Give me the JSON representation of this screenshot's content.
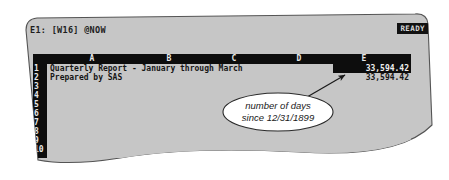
{
  "app": {
    "type": "dos-spreadsheet",
    "status_bar": {
      "cell_reference": "E1: [W16] @NOW",
      "mode_indicator": "READY"
    }
  },
  "worksheet": {
    "column_headers": [
      "A",
      "B",
      "C",
      "D",
      "E"
    ],
    "row_numbers": [
      "1",
      "2",
      "3",
      "4",
      "5",
      "6",
      "7",
      "8",
      "9",
      "10"
    ],
    "rows": [
      {
        "row": "1",
        "label_cell": "Quarterly Report - January through March",
        "value_cell": "33,594.42",
        "value_selected": true
      },
      {
        "row": "2",
        "label_cell": "Prepared by SAS",
        "value_cell": "33,594.42",
        "value_selected": false
      }
    ]
  },
  "annotation": {
    "callout_line_1": "number of days",
    "callout_line_2": "since 12/31/1899"
  },
  "colors": {
    "screen_background": "#c6c6c6",
    "screen_border": "#4a4a4a",
    "inverse_background": "#0d0d0d",
    "inverse_foreground": "#e8e8e8",
    "text": "#151515",
    "callout_fill": "#ffffff",
    "callout_stroke": "#2a2a2a"
  }
}
